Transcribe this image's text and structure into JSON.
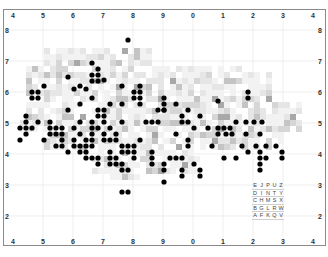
{
  "chart_data": {
    "type": "heatmap",
    "title": "",
    "grid_labels": {
      "top": [
        "4",
        "5",
        "6",
        "7",
        "8",
        "9",
        "0",
        "1",
        "2",
        "3",
        "4"
      ],
      "bottom": [
        "4",
        "5",
        "6",
        "7",
        "8",
        "9",
        "0",
        "1",
        "2",
        "3",
        "4"
      ],
      "left": [
        "4",
        "8",
        "7",
        "6",
        "5",
        "4",
        "3",
        "2",
        "4"
      ],
      "right": [
        "4",
        "8",
        "7",
        "6",
        "5",
        "4",
        "3",
        "2",
        "4"
      ]
    },
    "grid_on": true,
    "legend_key": {
      "rows": [
        [
          "E",
          "J",
          "P",
          "U",
          "Z"
        ],
        [
          "D",
          "I",
          "N",
          "T",
          "Y"
        ],
        [
          "C",
          "H",
          "M",
          "S",
          "X"
        ],
        [
          "B",
          "G",
          "L",
          "R",
          "W"
        ],
        [
          "A",
          "F",
          "K",
          "Q",
          "V"
        ]
      ]
    },
    "marker_style": "black filled circles",
    "cell_shading": "grayscale intensity squares",
    "dot_count_estimate": 170
  },
  "colors": {
    "frame": "#8a8a8a",
    "gridline": "#e6e6e6",
    "dot": "#000000",
    "cell_light": "#ececec",
    "cell_mid": "#c8c8c8",
    "cell_dark": "#9a9a9a"
  }
}
